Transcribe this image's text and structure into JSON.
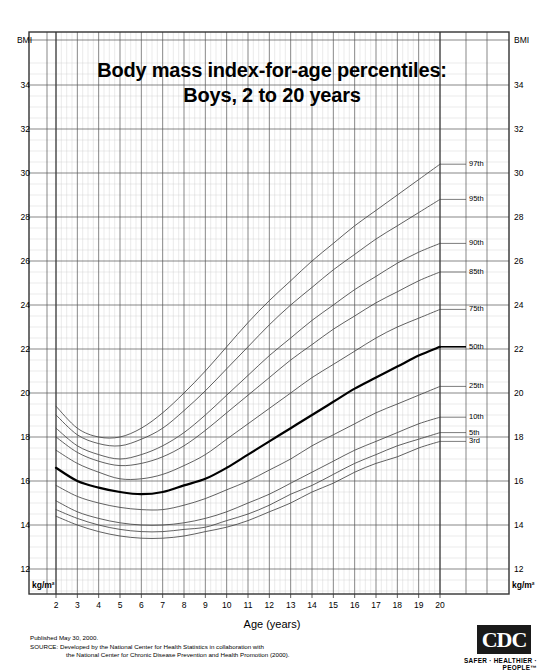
{
  "title": {
    "line1": "Body mass index-for-age percentiles:",
    "line2": "Boys, 2 to 20 years"
  },
  "axis": {
    "y_top_label": "BMI",
    "y_unit_label": "kg/m²",
    "x_title": "Age (years)"
  },
  "footer": {
    "published": "Published May 30, 2000.",
    "source_line1": "SOURCE: Developed by the National Center for Health Statistics in collaboration with",
    "source_line2": "the National Center for Chronic Disease Prevention and Health Promotion (2000)."
  },
  "logo": {
    "text": "CDC",
    "tagline": "SAFER · HEALTHIER · PEOPLE™"
  },
  "colors": {
    "grid_major": "#555555",
    "grid_minor": "#cccccc",
    "curve": "#444444",
    "curve_median": "#000000",
    "border": "#333333",
    "background": "#ffffff"
  },
  "chart_data": {
    "type": "line",
    "title": "Body mass index-for-age percentiles: Boys, 2 to 20 years",
    "xlabel": "Age (years)",
    "ylabel": "BMI (kg/m²)",
    "xlim": [
      2,
      20
    ],
    "ylim": [
      11,
      35.5
    ],
    "xticks": [
      2,
      3,
      4,
      5,
      6,
      7,
      8,
      9,
      10,
      11,
      12,
      13,
      14,
      15,
      16,
      17,
      18,
      19,
      20
    ],
    "yticks": [
      12,
      14,
      16,
      18,
      20,
      22,
      24,
      26,
      28,
      30,
      32,
      34
    ],
    "grid": true,
    "legend_position": "right-inline-labels",
    "x": [
      2,
      3,
      4,
      5,
      6,
      7,
      8,
      9,
      10,
      11,
      12,
      13,
      14,
      15,
      16,
      17,
      18,
      19,
      20
    ],
    "series": [
      {
        "name": "97th",
        "label": "97th",
        "values": [
          19.4,
          18.4,
          18.0,
          18.0,
          18.4,
          19.1,
          20.0,
          21.0,
          22.1,
          23.2,
          24.2,
          25.1,
          26.0,
          26.8,
          27.6,
          28.3,
          29.0,
          29.7,
          30.4
        ]
      },
      {
        "name": "95th",
        "label": "95th",
        "values": [
          19.0,
          18.1,
          17.7,
          17.6,
          17.9,
          18.4,
          19.2,
          20.1,
          21.1,
          22.1,
          23.1,
          24.0,
          24.8,
          25.6,
          26.3,
          27.0,
          27.6,
          28.2,
          28.8
        ]
      },
      {
        "name": "90th",
        "label": "90th",
        "values": [
          18.4,
          17.6,
          17.2,
          17.0,
          17.2,
          17.6,
          18.2,
          19.0,
          19.9,
          20.8,
          21.7,
          22.5,
          23.3,
          24.0,
          24.7,
          25.3,
          25.9,
          26.4,
          26.8
        ]
      },
      {
        "name": "85th",
        "label": "85th",
        "values": [
          18.0,
          17.3,
          16.9,
          16.7,
          16.8,
          17.1,
          17.6,
          18.3,
          19.1,
          19.9,
          20.7,
          21.5,
          22.2,
          22.9,
          23.5,
          24.1,
          24.6,
          25.1,
          25.5
        ]
      },
      {
        "name": "75th",
        "label": "75th",
        "values": [
          17.4,
          16.8,
          16.4,
          16.1,
          16.1,
          16.3,
          16.7,
          17.2,
          17.9,
          18.6,
          19.3,
          20.0,
          20.7,
          21.3,
          21.9,
          22.5,
          23.0,
          23.4,
          23.8
        ]
      },
      {
        "name": "50th",
        "label": "50th",
        "values": [
          16.6,
          16.0,
          15.7,
          15.5,
          15.4,
          15.5,
          15.8,
          16.1,
          16.6,
          17.2,
          17.8,
          18.4,
          19.0,
          19.6,
          20.2,
          20.7,
          21.2,
          21.7,
          22.1
        ],
        "highlight": true
      },
      {
        "name": "25th",
        "label": "25th",
        "values": [
          15.8,
          15.3,
          15.0,
          14.8,
          14.7,
          14.7,
          14.9,
          15.2,
          15.6,
          16.0,
          16.5,
          17.0,
          17.6,
          18.1,
          18.6,
          19.1,
          19.5,
          19.9,
          20.3
        ]
      },
      {
        "name": "10th",
        "label": "10th",
        "values": [
          15.1,
          14.6,
          14.3,
          14.1,
          14.0,
          14.0,
          14.1,
          14.3,
          14.6,
          15.0,
          15.4,
          15.9,
          16.4,
          16.9,
          17.4,
          17.8,
          18.2,
          18.6,
          18.9
        ]
      },
      {
        "name": "5th",
        "label": "5th",
        "values": [
          14.7,
          14.3,
          14.0,
          13.8,
          13.7,
          13.7,
          13.8,
          13.9,
          14.2,
          14.5,
          14.9,
          15.4,
          15.8,
          16.3,
          16.8,
          17.2,
          17.6,
          17.9,
          18.2
        ]
      },
      {
        "name": "3rd",
        "label": "3rd",
        "values": [
          14.4,
          14.0,
          13.7,
          13.5,
          13.4,
          13.4,
          13.5,
          13.7,
          13.9,
          14.2,
          14.6,
          15.0,
          15.5,
          15.9,
          16.4,
          16.8,
          17.1,
          17.5,
          17.8
        ]
      }
    ]
  },
  "y_tick_labels": [
    "34",
    "32",
    "30",
    "28",
    "26",
    "24",
    "22",
    "20",
    "18",
    "16",
    "14",
    "12"
  ],
  "x_tick_labels": [
    "2",
    "3",
    "4",
    "5",
    "6",
    "7",
    "8",
    "9",
    "10",
    "11",
    "12",
    "13",
    "14",
    "15",
    "16",
    "17",
    "18",
    "19",
    "20"
  ]
}
